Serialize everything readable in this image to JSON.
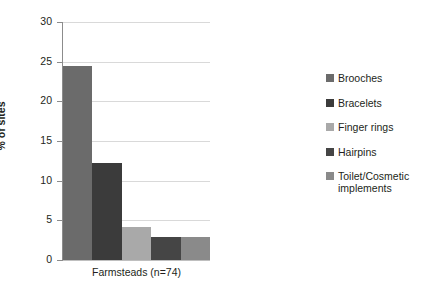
{
  "chart_data": {
    "type": "bar",
    "title": "",
    "xlabel": "Farmsteads (n=74)",
    "ylabel": "% of sites",
    "categories": [
      "Farmsteads (n=74)"
    ],
    "ylim": [
      0,
      30
    ],
    "yticks": [
      0,
      5,
      10,
      15,
      20,
      25,
      30
    ],
    "ytick_labels": [
      "0",
      "5",
      "10",
      "15",
      "20",
      "25",
      "30"
    ],
    "grid": true,
    "legend_position": "right",
    "series": [
      {
        "name": "Brooches",
        "values": [
          24.4
        ],
        "color": "#6b6b6b"
      },
      {
        "name": "Bracelets",
        "values": [
          12.2
        ],
        "color": "#3b3b3b"
      },
      {
        "name": "Finger rings",
        "values": [
          4.1
        ],
        "color": "#a9a9a9"
      },
      {
        "name": "Hairpins",
        "values": [
          2.9
        ],
        "color": "#454545"
      },
      {
        "name": "Toilet/Cosmetic implements",
        "values": [
          2.9
        ],
        "color": "#8a8a8a"
      }
    ]
  },
  "axis": {
    "y_title": "% of sites",
    "x_title": "Farmsteads (n=74)"
  },
  "legend": {
    "items": [
      {
        "label": "Brooches",
        "color": "#6b6b6b"
      },
      {
        "label": "Bracelets",
        "color": "#3b3b3b"
      },
      {
        "label": "Finger rings",
        "color": "#a9a9a9"
      },
      {
        "label": "Hairpins",
        "color": "#454545"
      },
      {
        "label": "Toilet/Cosmetic implements",
        "color": "#8a8a8a"
      }
    ]
  }
}
